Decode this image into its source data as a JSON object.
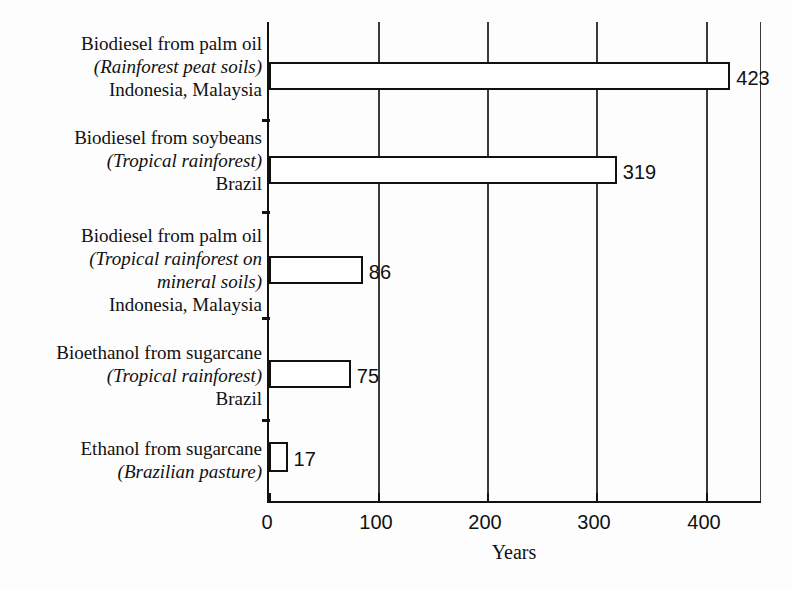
{
  "chart_data": {
    "type": "bar",
    "orientation": "horizontal",
    "title": "",
    "xlabel": "Years",
    "ylabel": "",
    "xlim": [
      0,
      453
    ],
    "xticks": [
      0,
      100,
      200,
      300,
      400
    ],
    "xticklabels": [
      "0",
      "100",
      "200",
      "300",
      "400"
    ],
    "grid": "vertical",
    "legend": "none",
    "categories": [
      "Biodiesel from palm oil (Rainforest peat soils) Indonesia, Malaysia",
      "Biodiesel from soybeans (Tropical rainforest) Brazil",
      "Biodiesel from palm oil (Tropical rainforest on mineral soils) Indonesia, Malaysia",
      "Bioethanol from sugarcane (Tropical rainforest) Brazil",
      "Ethanol from sugarcane (Brazilian pasture)"
    ],
    "values": [
      423,
      319,
      86,
      75,
      17
    ],
    "value_labels": [
      "423",
      "319",
      "86",
      "75",
      "17"
    ],
    "bar_fill": "#ffffff",
    "bar_stroke": "#111111"
  },
  "categories": [
    {
      "lines": [
        {
          "text": "Biodiesel from palm oil",
          "style": "roman"
        },
        {
          "text": "(Rainforest peat soils)",
          "style": "italic"
        },
        {
          "text": "Indonesia, Malaysia",
          "style": "roman"
        }
      ],
      "value": 423,
      "value_label": "423"
    },
    {
      "lines": [
        {
          "text": "Biodiesel from soybeans",
          "style": "roman"
        },
        {
          "text": "(Tropical rainforest)",
          "style": "italic"
        },
        {
          "text": "Brazil",
          "style": "roman"
        }
      ],
      "value": 319,
      "value_label": "319"
    },
    {
      "lines": [
        {
          "text": "Biodiesel from palm oil",
          "style": "roman"
        },
        {
          "text": "(Tropical rainforest on",
          "style": "italic"
        },
        {
          "text": "mineral soils)",
          "style": "italic"
        },
        {
          "text": "Indonesia, Malaysia",
          "style": "roman"
        }
      ],
      "value": 86,
      "value_label": "86"
    },
    {
      "lines": [
        {
          "text": "Bioethanol from sugarcane",
          "style": "roman"
        },
        {
          "text": "(Tropical rainforest)",
          "style": "italic"
        },
        {
          "text": "Brazil",
          "style": "roman"
        }
      ],
      "value": 75,
      "value_label": "75"
    },
    {
      "lines": [
        {
          "text": "Ethanol from sugarcane",
          "style": "roman"
        },
        {
          "text": "(Brazilian pasture)",
          "style": "italic"
        }
      ],
      "value": 17,
      "value_label": "17"
    }
  ],
  "axis": {
    "x_title": "Years",
    "x_ticks": [
      "0",
      "100",
      "200",
      "300",
      "400"
    ]
  }
}
